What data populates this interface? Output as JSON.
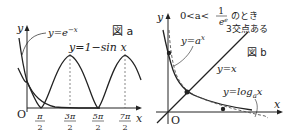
{
  "figure_a": {
    "tag": "図 a",
    "axis_y_label": "y",
    "axis_x_label": "x",
    "origin_label": "O",
    "curve1_label": "y=e",
    "curve1_exp": "−x",
    "curve2_label": "y=1−sin x",
    "ticks": [
      {
        "num": "π",
        "den": "2"
      },
      {
        "num": "3π",
        "den": "2"
      },
      {
        "num": "5π",
        "den": "2"
      },
      {
        "num": "7π",
        "den": "2"
      }
    ]
  },
  "figure_b": {
    "tag": "図 b",
    "axis_y_label": "y",
    "axis_x_label": "x",
    "origin_label": "O",
    "condition_prefix": "0<a<",
    "condition_num": "1",
    "condition_den": "e",
    "condition_den_exp": "e",
    "condition_suffix": "のとき",
    "intersections_note": "3交点ある",
    "curve1_label": "y=a",
    "curve1_exp": "x",
    "line_label": "y=x",
    "curve2_label": "y=log",
    "curve2_sub": "a",
    "curve2_tail": "x"
  },
  "colors": {
    "curve": "#222222",
    "axis": "#222222",
    "dashed": "#555555"
  }
}
